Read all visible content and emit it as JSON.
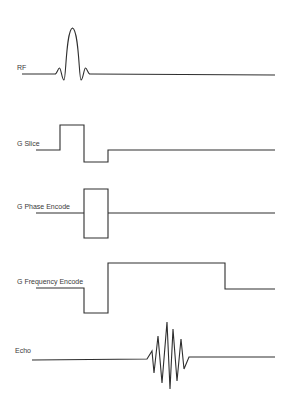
{
  "diagram": {
    "stroke_color": "#2e2e2e",
    "label_color": "#3a3a3a",
    "background": "#ffffff",
    "rows": [
      {
        "id": "rf",
        "label": "RF",
        "label_pos": [
          17,
          64
        ],
        "shape": "sinc pulse",
        "path": "M22,74 L55,74 C57,74 58,68 59.5,68 C61,68 62,80 64,80 C66,80 66,30 72.5,28 C79,30 79,80 81,80 C83,80 84,68 85.5,68 C87,68 88,74 90,74 L275,75"
      },
      {
        "id": "g-slice",
        "label": "G Slice",
        "label_pos": [
          17,
          140
        ],
        "shape": "slice-select gradient with refocusing lobe",
        "path": "M36,150 L60,150 L60,125 L84,125 L84,162 L108,162 L108,150 L275,150"
      },
      {
        "id": "g-phase",
        "label": "G Phase Encode",
        "label_pos": [
          17,
          203
        ],
        "shape": "phase-encode gradient table",
        "path": "M36,213 L84,213 M84,189 L108,189 L108,238 L84,238 Z M108,213 L275,213"
      },
      {
        "id": "g-frequency",
        "label": "G Frequency Encode",
        "label_pos": [
          17,
          278
        ],
        "shape": "readout gradient with dephasing lobe",
        "path": "M36,288 L84,288 L84,313 L108,313 L108,263 L225,263 L225,289 L275,289"
      },
      {
        "id": "echo",
        "label": "Echo",
        "label_pos": [
          15,
          347
        ],
        "shape": "echo signal",
        "path": "M32,360 L147,359 L152,351 L154,373 L158,336 L162,383 L167,322 L170,389 L173,329 L177,381 L181,339 L184,369 L189,357 L275,357"
      }
    ]
  }
}
